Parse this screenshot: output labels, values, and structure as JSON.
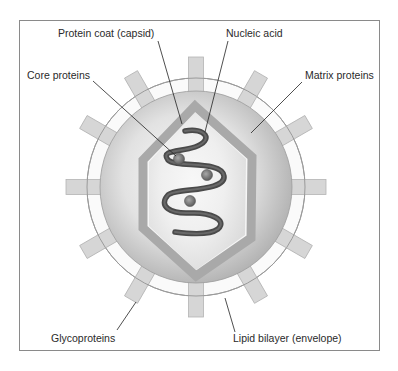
{
  "figure": {
    "type": "virus-structure-diagram",
    "labels": {
      "capsid": "Protein coat (capsid)",
      "nucleic_acid": "Nucleic acid",
      "core_proteins": "Core proteins",
      "matrix_proteins": "Matrix proteins",
      "glycoproteins": "Glycoproteins",
      "lipid_bilayer": "Lipid bilayer (envelope)"
    },
    "colors": {
      "frame": "#8a8a8a",
      "sphere_light": "#f4f4f4",
      "sphere_dark": "#b0b0b0",
      "capsid": "#a9a9a9",
      "nucleic_acid": "#555555",
      "core_protein": "#7a7a7a",
      "spike_fill": "#d6d6d6",
      "spike_stroke": "#b4b4b4",
      "envelope_ring": "#9a9a9a",
      "leader_line": "#222222"
    },
    "spike_count": 12
  }
}
